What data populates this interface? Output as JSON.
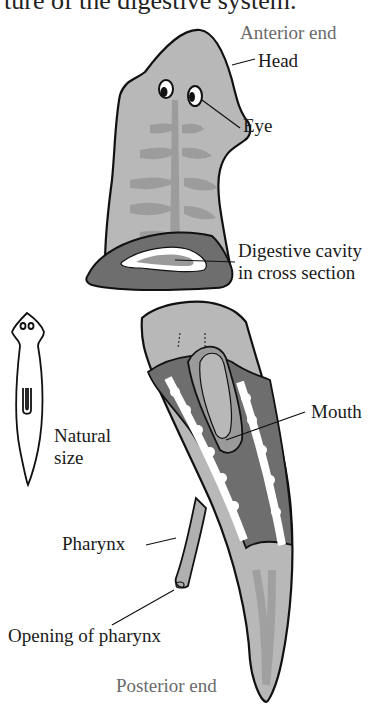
{
  "caption": {
    "text": "ture of the digestive system."
  },
  "labels": {
    "anterior_end": "Anterior end",
    "head": "Head",
    "eye": "Eye",
    "digestive_cavity_line1": "Digestive cavity",
    "digestive_cavity_line2": "in cross section",
    "mouth": "Mouth",
    "natural_size_line1": "Natural",
    "natural_size_line2": "size",
    "pharynx": "Pharynx",
    "opening_of_pharynx": "Opening of pharynx",
    "posterior_end": "Posterior end"
  },
  "colors": {
    "body_fill": "#b8b8b8",
    "gut_fill": "#9a9a9a",
    "cut_section_fill": "#6e6e6e",
    "cavity_fill": "#ffffff",
    "outline": "#111111",
    "label_text": "#1a1a1a",
    "end_label_text": "#6a6a6a"
  }
}
